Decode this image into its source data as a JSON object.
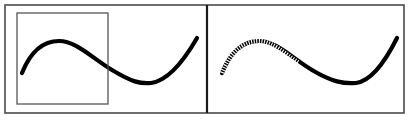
{
  "figure": {
    "width": 413,
    "height": 121,
    "background_color": "#ffffff",
    "stroke_color": "#000000",
    "frame_color": "#4a4a4a",
    "roi_box_color": "#555555",
    "panel_count": 2
  },
  "frame": {
    "name": "outer-frame",
    "x": 5,
    "y": 5,
    "width": 399,
    "height": 108,
    "stroke_width": 1.6
  },
  "divider": {
    "name": "panel-divider",
    "x": 207,
    "y_top": 5,
    "y_bottom": 113,
    "stroke_width": 2.2
  },
  "panels": [
    {
      "id": "left-panel",
      "label": "Original curve with selection box",
      "x": 5,
      "y": 5,
      "width": 202,
      "height": 108,
      "curve": {
        "name": "sine-curve-solid",
        "style": "solid",
        "stroke_width": 4.2,
        "path": "M 22,73 C 30,53 42,41 59,41 C 76,41 92,58 112,70 C 132,82 140,84 151,83 C 166,81 182,64 197,38",
        "start_point": [
          22,
          73
        ],
        "peak_point": [
          59,
          41
        ],
        "trough_point": [
          151,
          83
        ],
        "end_point": [
          197,
          38
        ]
      },
      "roi_box": {
        "name": "roi-selection-box",
        "x": 17,
        "y": 13,
        "width": 91,
        "height": 91,
        "stroke_width": 1.3,
        "fill": "none"
      }
    },
    {
      "id": "right-panel",
      "label": "Curve with highlighted region rendered as dotted segment",
      "x": 207,
      "y": 5,
      "width": 197,
      "height": 108,
      "curve": {
        "name": "sine-curve-mixed",
        "style": "solid-with-dotted-segment",
        "stroke_width": 4.2,
        "path": "M 222,73 C 230,53 242,41 259,41 C 276,41 292,58 312,70 C 332,82 344,84 356,83 C 371,81 384,64 397,38",
        "start_point": [
          222,
          73
        ],
        "peak_point": [
          259,
          41
        ],
        "trough_point": [
          356,
          83
        ],
        "end_point": [
          397,
          38
        ]
      },
      "dotted_overlay": {
        "name": "dotted-roi-segment",
        "style": "dotted",
        "dash_pattern": "1.1 1.5",
        "stroke_width": 4.4,
        "stroke_color": "#ffffff",
        "path": "M 222,73 C 230,53 242,41 259,41 C 272,41 284,53 299,63",
        "covers_x_range": [
          222,
          299
        ]
      }
    }
  ]
}
